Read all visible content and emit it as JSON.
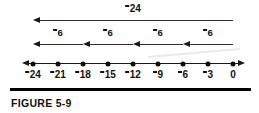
{
  "figure": {
    "caption": "FIGURE 5-9",
    "colors": {
      "ink": "#121212",
      "line": "#2e2e2e",
      "rule": "#000000",
      "background": "#ffffff"
    }
  },
  "number_line": {
    "start_x": 33,
    "spacing": 25,
    "y": 63,
    "left_arrow": true,
    "right_arrow": true,
    "ticks": [
      {
        "value": -24,
        "label_digits": "24",
        "negative": true,
        "x": 33,
        "name": "tick-minus-24"
      },
      {
        "value": -21,
        "label_digits": "21",
        "negative": true,
        "x": 58,
        "name": "tick-minus-21"
      },
      {
        "value": -18,
        "label_digits": "18",
        "negative": true,
        "x": 83,
        "name": "tick-minus-18"
      },
      {
        "value": -15,
        "label_digits": "15",
        "negative": true,
        "x": 108,
        "name": "tick-minus-15"
      },
      {
        "value": -12,
        "label_digits": "12",
        "negative": true,
        "x": 133,
        "name": "tick-minus-12"
      },
      {
        "value": -9,
        "label_digits": "9",
        "negative": true,
        "x": 158,
        "name": "tick-minus-9"
      },
      {
        "value": -6,
        "label_digits": "6",
        "negative": true,
        "x": 183,
        "name": "tick-minus-6"
      },
      {
        "value": -3,
        "label_digits": "3",
        "negative": true,
        "x": 208,
        "name": "tick-minus-3"
      },
      {
        "value": 0,
        "label_digits": "0",
        "negative": false,
        "x": 233,
        "name": "tick-zero"
      }
    ]
  },
  "jumps": {
    "total": {
      "label_digits": "24",
      "negative": true,
      "label_x": 133,
      "label_y": 3,
      "from_x": 233,
      "to_x": 33,
      "y": 20,
      "direction": "left"
    },
    "steps": [
      {
        "label_digits": "6",
        "negative": true,
        "label_x": 58,
        "label_y": 27,
        "from_x": 83,
        "to_x": 33,
        "y": 44,
        "direction": "left"
      },
      {
        "label_digits": "6",
        "negative": true,
        "label_x": 108,
        "label_y": 27,
        "from_x": 133,
        "to_x": 83,
        "y": 44,
        "direction": "left"
      },
      {
        "label_digits": "6",
        "negative": true,
        "label_x": 158,
        "label_y": 27,
        "from_x": 183,
        "to_x": 133,
        "y": 44,
        "direction": "left"
      },
      {
        "label_digits": "6",
        "negative": true,
        "label_x": 208,
        "label_y": 27,
        "from_x": 233,
        "to_x": 183,
        "y": 44,
        "direction": "left"
      }
    ]
  },
  "caption_block": {
    "rule_x": 10,
    "rule_y": 88,
    "rule_width": 241,
    "text_x": 11,
    "text_y": 97
  }
}
